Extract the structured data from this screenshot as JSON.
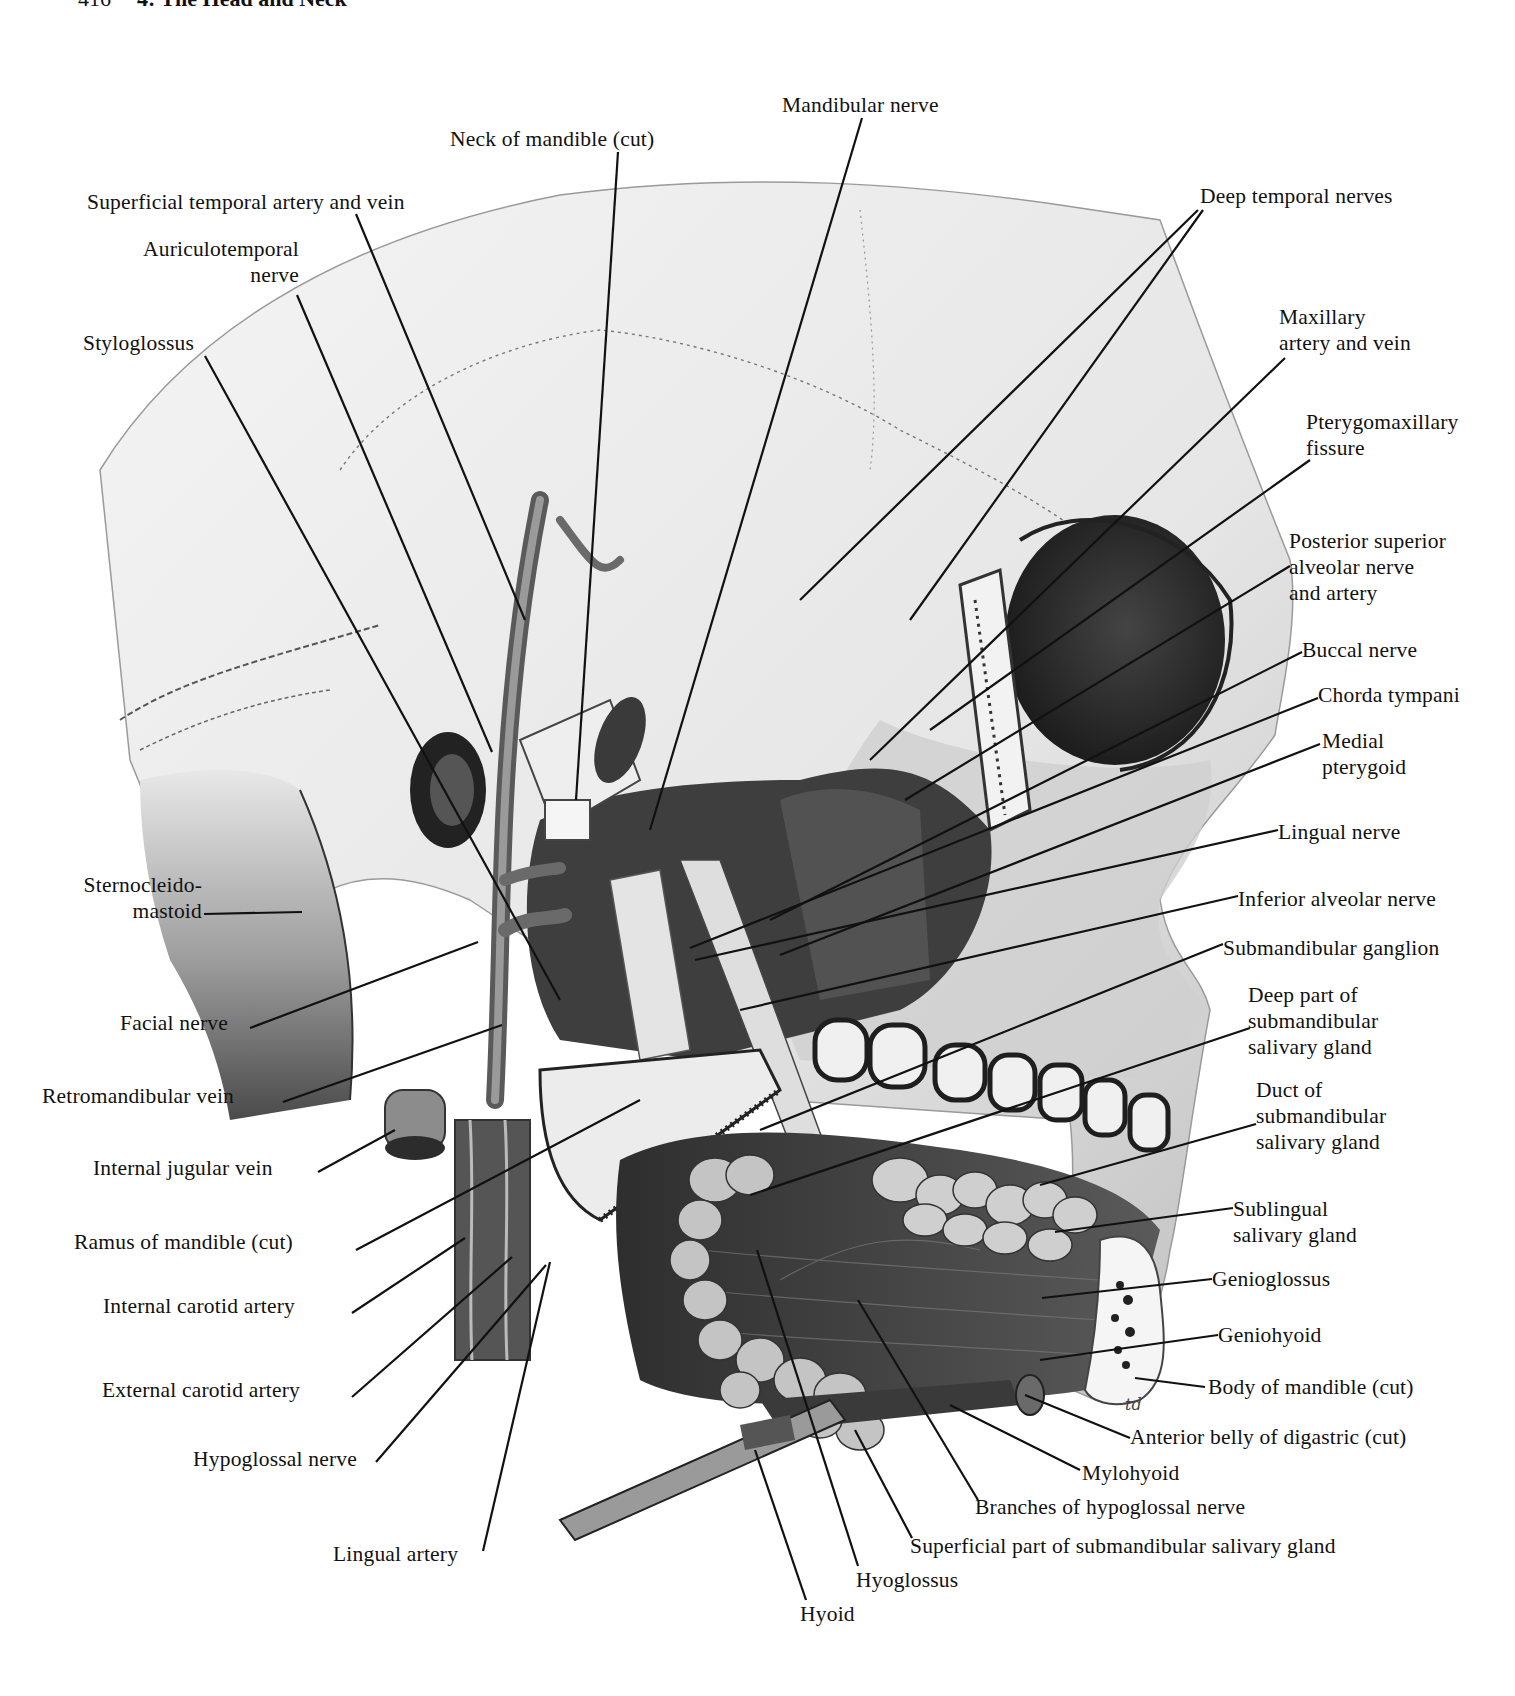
{
  "page": {
    "header_page_number": "416",
    "header_title": "4: The Head and Neck"
  },
  "colors": {
    "background": "#ffffff",
    "ink": "#111111",
    "bone_light": "#e9e9e9",
    "tissue_mid": "#8a8a8a",
    "tissue_dark": "#3a3a3a",
    "gland": "#bdbdbd"
  },
  "labels": [
    {
      "id": "mandibular-nerve",
      "text": "Mandibular nerve",
      "x": 782,
      "y": 92,
      "align": "left",
      "line": [
        [
          862,
          118
        ],
        [
          650,
          830
        ]
      ]
    },
    {
      "id": "neck-of-mandible",
      "text": "Neck of mandible (cut)",
      "x": 450,
      "y": 126,
      "align": "left",
      "line": [
        [
          618,
          152
        ],
        [
          576,
          800
        ]
      ]
    },
    {
      "id": "superficial-temporal",
      "text": "Superficial temporal artery and vein",
      "x": 87,
      "y": 189,
      "align": "left",
      "line": [
        [
          356,
          214
        ],
        [
          525,
          620
        ]
      ]
    },
    {
      "id": "auriculotemporal",
      "text": "Auriculotemporal\nnerve",
      "x": 107,
      "y": 236,
      "align": "right",
      "w": 192,
      "line": [
        [
          297,
          295
        ],
        [
          492,
          752
        ]
      ]
    },
    {
      "id": "styloglossus",
      "text": "Styloglossus",
      "x": 83,
      "y": 330,
      "align": "left",
      "line": [
        [
          205,
          356
        ],
        [
          560,
          1000
        ]
      ]
    },
    {
      "id": "deep-temporal",
      "text": "Deep temporal nerves",
      "x": 1200,
      "y": 183,
      "align": "left",
      "line": [
        [
          1198,
          210
        ],
        [
          800,
          600
        ]
      ],
      "line2": [
        [
          1203,
          210
        ],
        [
          910,
          620
        ]
      ]
    },
    {
      "id": "maxillary-artery",
      "text": "Maxillary\nartery and vein",
      "x": 1279,
      "y": 304,
      "align": "left",
      "line": [
        [
          1285,
          358
        ],
        [
          870,
          760
        ]
      ]
    },
    {
      "id": "pterygomaxillary",
      "text": "Pterygomaxillary\nfissure",
      "x": 1306,
      "y": 409,
      "align": "left",
      "line": [
        [
          1310,
          460
        ],
        [
          930,
          730
        ]
      ]
    },
    {
      "id": "posterior-superior-alveolar",
      "text": "Posterior superior\nalveolar nerve\nand artery",
      "x": 1289,
      "y": 528,
      "align": "left",
      "line": [
        [
          1290,
          566
        ],
        [
          905,
          800
        ]
      ]
    },
    {
      "id": "buccal-nerve",
      "text": "Buccal nerve",
      "x": 1302,
      "y": 637,
      "align": "left",
      "line": [
        [
          1302,
          652
        ],
        [
          770,
          920
        ]
      ]
    },
    {
      "id": "chorda-tympani",
      "text": "Chorda tympani",
      "x": 1318,
      "y": 682,
      "align": "left",
      "line": [
        [
          1318,
          698
        ],
        [
          690,
          948
        ]
      ]
    },
    {
      "id": "medial-pterygoid",
      "text": "Medial\npterygoid",
      "x": 1322,
      "y": 728,
      "align": "left",
      "line": [
        [
          1320,
          744
        ],
        [
          780,
          955
        ]
      ]
    },
    {
      "id": "lingual-nerve",
      "text": "Lingual nerve",
      "x": 1278,
      "y": 819,
      "align": "left",
      "line": [
        [
          1278,
          830
        ],
        [
          695,
          960
        ]
      ]
    },
    {
      "id": "inferior-alveolar",
      "text": "Inferior alveolar nerve",
      "x": 1238,
      "y": 886,
      "align": "left",
      "line": [
        [
          1238,
          896
        ],
        [
          740,
          1010
        ]
      ]
    },
    {
      "id": "submandibular-ganglion",
      "text": "Submandibular ganglion",
      "x": 1223,
      "y": 935,
      "align": "left",
      "line": [
        [
          1223,
          944
        ],
        [
          760,
          1130
        ]
      ]
    },
    {
      "id": "deep-part-submandibular",
      "text": "Deep part of\nsubmandibular\nsalivary gland",
      "x": 1248,
      "y": 982,
      "align": "left",
      "line": [
        [
          1250,
          1028
        ],
        [
          750,
          1195
        ]
      ]
    },
    {
      "id": "duct-submandibular",
      "text": "Duct of\nsubmandibular\nsalivary gland",
      "x": 1256,
      "y": 1077,
      "align": "left",
      "line": [
        [
          1256,
          1124
        ],
        [
          1040,
          1185
        ]
      ]
    },
    {
      "id": "sublingual-gland",
      "text": "Sublingual\nsalivary gland",
      "x": 1233,
      "y": 1196,
      "align": "left",
      "line": [
        [
          1233,
          1208
        ],
        [
          1055,
          1232
        ]
      ]
    },
    {
      "id": "genioglossus",
      "text": "Genioglossus",
      "x": 1212,
      "y": 1266,
      "align": "left",
      "line": [
        [
          1212,
          1279
        ],
        [
          1042,
          1298
        ]
      ]
    },
    {
      "id": "geniohyoid",
      "text": "Geniohyoid",
      "x": 1218,
      "y": 1322,
      "align": "left",
      "line": [
        [
          1218,
          1335
        ],
        [
          1040,
          1360
        ]
      ]
    },
    {
      "id": "body-of-mandible",
      "text": "Body of mandible (cut)",
      "x": 1208,
      "y": 1374,
      "align": "left",
      "line": [
        [
          1205,
          1387
        ],
        [
          1135,
          1378
        ]
      ]
    },
    {
      "id": "anterior-belly-digastric",
      "text": "Anterior belly of digastric (cut)",
      "x": 1130,
      "y": 1424,
      "align": "left",
      "line": [
        [
          1130,
          1438
        ],
        [
          1025,
          1395
        ]
      ]
    },
    {
      "id": "mylohyoid",
      "text": "Mylohyoid",
      "x": 1082,
      "y": 1460,
      "align": "left",
      "line": [
        [
          1080,
          1470
        ],
        [
          950,
          1405
        ]
      ]
    },
    {
      "id": "branches-hypoglossal",
      "text": "Branches of hypoglossal nerve",
      "x": 975,
      "y": 1494,
      "align": "left",
      "line": [
        [
          978,
          1500
        ],
        [
          858,
          1300
        ]
      ]
    },
    {
      "id": "superficial-part-submandibular",
      "text": "Superficial part of submandibular salivary gland",
      "x": 910,
      "y": 1533,
      "align": "left",
      "line": [
        [
          912,
          1538
        ],
        [
          855,
          1430
        ]
      ]
    },
    {
      "id": "hyoglossus",
      "text": "Hyoglossus",
      "x": 856,
      "y": 1567,
      "align": "left",
      "line": [
        [
          858,
          1566
        ],
        [
          757,
          1250
        ]
      ]
    },
    {
      "id": "hyoid",
      "text": "Hyoid",
      "x": 800,
      "y": 1601,
      "align": "left",
      "line": [
        [
          806,
          1600
        ],
        [
          755,
          1450
        ]
      ]
    },
    {
      "id": "sternocleidomastoid",
      "text": "Sternocleido-\nmastoid",
      "x": 52,
      "y": 872,
      "align": "right",
      "w": 150,
      "line": [
        [
          204,
          914
        ],
        [
          302,
          912
        ]
      ]
    },
    {
      "id": "facial-nerve",
      "text": "Facial nerve",
      "x": 120,
      "y": 1010,
      "align": "left",
      "line": [
        [
          250,
          1028
        ],
        [
          478,
          942
        ]
      ]
    },
    {
      "id": "retromandibular-vein",
      "text": "Retromandibular vein",
      "x": 42,
      "y": 1083,
      "align": "left",
      "line": [
        [
          283,
          1102
        ],
        [
          502,
          1025
        ]
      ]
    },
    {
      "id": "internal-jugular-vein",
      "text": "Internal jugular vein",
      "x": 93,
      "y": 1155,
      "align": "left",
      "line": [
        [
          318,
          1172
        ],
        [
          395,
          1130
        ]
      ]
    },
    {
      "id": "ramus-of-mandible",
      "text": "Ramus of mandible (cut)",
      "x": 74,
      "y": 1229,
      "align": "left",
      "line": [
        [
          356,
          1250
        ],
        [
          640,
          1100
        ]
      ]
    },
    {
      "id": "internal-carotid",
      "text": "Internal carotid artery",
      "x": 103,
      "y": 1293,
      "align": "left",
      "line": [
        [
          352,
          1313
        ],
        [
          465,
          1238
        ]
      ]
    },
    {
      "id": "external-carotid",
      "text": "External carotid artery",
      "x": 102,
      "y": 1377,
      "align": "left",
      "line": [
        [
          352,
          1397
        ],
        [
          512,
          1257
        ]
      ]
    },
    {
      "id": "hypoglossal-nerve",
      "text": "Hypoglossal nerve",
      "x": 193,
      "y": 1446,
      "align": "left",
      "line": [
        [
          376,
          1462
        ],
        [
          546,
          1265
        ]
      ]
    },
    {
      "id": "lingual-artery",
      "text": "Lingual artery",
      "x": 333,
      "y": 1541,
      "align": "left",
      "line": [
        [
          483,
          1551
        ],
        [
          550,
          1262
        ]
      ]
    }
  ],
  "signature": "td"
}
